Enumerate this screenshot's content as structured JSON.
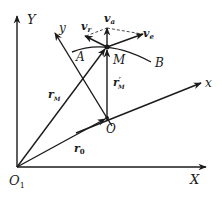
{
  "diagram": {
    "type": "kinematics-relative-motion",
    "labels": {
      "Y": "Y",
      "X": "X",
      "O1": "O",
      "O1_sub": "1",
      "x": "x",
      "y": "y",
      "O": "O",
      "M": "M",
      "A": "A",
      "B": "B",
      "v_a": "v",
      "v_a_sub": "a",
      "v_r": "v",
      "v_r_sub": "r",
      "v_e": "v",
      "v_e_sub": "e",
      "r_M": "r",
      "r_M_sub": "M",
      "r_prime_M": "r",
      "r_prime_M_sup": "′",
      "r_prime_M_sub": "M",
      "r_0": "r",
      "r_0_sub": "0"
    },
    "colors": {
      "line": "#1a1a1a",
      "background": "#ffffff"
    }
  }
}
